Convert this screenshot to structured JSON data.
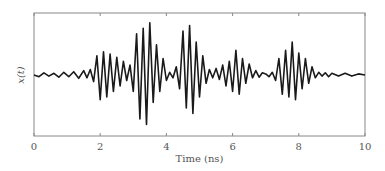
{
  "chart_data": {
    "type": "line",
    "title": "",
    "xlabel": "Time (ns)",
    "ylabel": "x(t)",
    "xlim": [
      0,
      10
    ],
    "ylim": [
      -1,
      1
    ],
    "xticks": [
      "0",
      "2",
      "4",
      "6",
      "8",
      "10"
    ],
    "yticks": [],
    "grid": false,
    "legend": null,
    "series": [
      {
        "name": "x(t)",
        "color": "#1a1a1a",
        "x": [
          0.0,
          0.15,
          0.3,
          0.45,
          0.6,
          0.75,
          0.9,
          1.05,
          1.2,
          1.35,
          1.5,
          1.6,
          1.7,
          1.8,
          1.9,
          2.0,
          2.1,
          2.2,
          2.3,
          2.4,
          2.5,
          2.6,
          2.7,
          2.8,
          2.9,
          3.0,
          3.1,
          3.2,
          3.3,
          3.4,
          3.5,
          3.6,
          3.7,
          3.8,
          3.9,
          4.0,
          4.1,
          4.2,
          4.3,
          4.4,
          4.5,
          4.6,
          4.7,
          4.8,
          4.9,
          5.0,
          5.1,
          5.2,
          5.3,
          5.4,
          5.5,
          5.6,
          5.7,
          5.8,
          5.9,
          6.0,
          6.1,
          6.2,
          6.3,
          6.4,
          6.5,
          6.6,
          6.7,
          6.8,
          6.9,
          7.0,
          7.1,
          7.2,
          7.3,
          7.4,
          7.5,
          7.6,
          7.7,
          7.8,
          7.9,
          8.0,
          8.1,
          8.2,
          8.3,
          8.4,
          8.5,
          8.6,
          8.7,
          8.8,
          8.9,
          9.0,
          9.2,
          9.4,
          9.6,
          9.8,
          10.0
        ],
        "y": [
          0.0,
          -0.03,
          0.04,
          -0.02,
          0.03,
          -0.04,
          0.05,
          -0.03,
          0.06,
          -0.06,
          0.08,
          -0.05,
          0.1,
          -0.12,
          0.35,
          -0.45,
          0.42,
          -0.4,
          0.38,
          -0.3,
          0.32,
          -0.2,
          0.25,
          -0.1,
          0.18,
          -0.3,
          0.75,
          -0.8,
          0.85,
          -0.9,
          0.95,
          -0.5,
          0.55,
          -0.3,
          0.3,
          -0.1,
          0.05,
          -0.05,
          0.15,
          -0.25,
          0.8,
          -0.6,
          0.9,
          -0.7,
          0.6,
          -0.4,
          0.35,
          -0.15,
          0.1,
          -0.05,
          0.12,
          -0.08,
          0.18,
          -0.2,
          0.25,
          -0.3,
          0.45,
          -0.35,
          0.3,
          -0.15,
          0.2,
          -0.05,
          0.08,
          -0.04,
          0.04,
          0.02,
          -0.03,
          0.05,
          -0.1,
          0.3,
          -0.35,
          0.45,
          -0.4,
          0.6,
          -0.45,
          0.4,
          -0.25,
          0.3,
          -0.15,
          0.15,
          -0.05,
          0.05,
          -0.02,
          0.04,
          -0.03,
          0.03,
          -0.02,
          0.03,
          -0.02,
          0.02,
          0.0
        ]
      }
    ]
  }
}
